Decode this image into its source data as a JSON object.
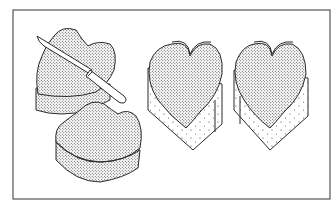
{
  "illustration": {
    "alt": "Line drawing of heart-shaped cakes: a knife trimming a stacked heart cake, a second heart cake, and two heart cakes standing upright with paper-lined sides",
    "colors": {
      "background": "#ffffff",
      "ink": "#2a2a2a",
      "frame": "#555555"
    },
    "elements": [
      {
        "name": "stacked-heart-cake-with-knife"
      },
      {
        "name": "heart-cake-bottom"
      },
      {
        "name": "upright-heart-cake-left"
      },
      {
        "name": "upright-heart-cake-right"
      }
    ]
  }
}
